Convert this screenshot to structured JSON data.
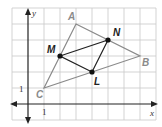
{
  "diagram": {
    "grid": {
      "unit_px": 16,
      "origin_px": [
        28,
        104
      ],
      "x_range": [
        -1,
        8
      ],
      "y_range": [
        -1,
        6
      ],
      "line_color": "#c8c8c8"
    },
    "axes": {
      "x_label": "x",
      "y_label": "y",
      "x_tick_label": "1",
      "y_tick_label": "1",
      "color": "#222222"
    },
    "vertices": [
      {
        "name": "A",
        "x": 3,
        "y": 5
      },
      {
        "name": "B",
        "x": 7,
        "y": 3
      },
      {
        "name": "C",
        "x": 1,
        "y": 1
      }
    ],
    "midpoints": [
      {
        "name": "M",
        "x": 2,
        "y": 3
      },
      {
        "name": "N",
        "x": 5,
        "y": 4
      },
      {
        "name": "L",
        "x": 4,
        "y": 2
      }
    ],
    "colors": {
      "outer_triangle": "#8a8a8a",
      "midsegment_triangle": "#222222",
      "point": "#111111"
    }
  }
}
